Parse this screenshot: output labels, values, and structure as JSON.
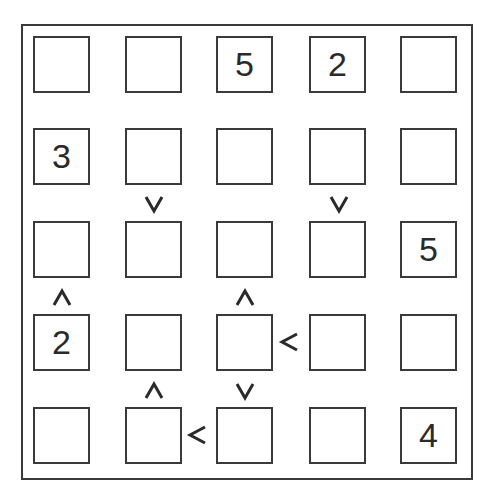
{
  "puzzle": {
    "type": "futoshiki",
    "size": 5,
    "grid": [
      [
        "",
        "",
        "5",
        "2",
        ""
      ],
      [
        "3",
        "",
        "",
        "",
        ""
      ],
      [
        "",
        "",
        "",
        "",
        "5"
      ],
      [
        "2",
        "",
        "",
        "",
        ""
      ],
      [
        "",
        "",
        "",
        "",
        "4"
      ]
    ],
    "constraints": [
      {
        "between": [
          [
            1,
            1
          ],
          [
            2,
            1
          ]
        ],
        "direction": "down",
        "glyph": "v",
        "meaning": "r1c1 > r2c1"
      },
      {
        "between": [
          [
            1,
            3
          ],
          [
            2,
            3
          ]
        ],
        "direction": "down",
        "glyph": "v",
        "meaning": "r1c3 > r2c3"
      },
      {
        "between": [
          [
            2,
            0
          ],
          [
            3,
            0
          ]
        ],
        "direction": "up",
        "glyph": "^",
        "meaning": "r2c0 < r3c0"
      },
      {
        "between": [
          [
            2,
            2
          ],
          [
            3,
            2
          ]
        ],
        "direction": "up",
        "glyph": "^",
        "meaning": "r2c2 < r3c2"
      },
      {
        "between": [
          [
            3,
            2
          ],
          [
            3,
            3
          ]
        ],
        "direction": "left",
        "glyph": "<",
        "meaning": "r3c2 < r3c3"
      },
      {
        "between": [
          [
            3,
            1
          ],
          [
            4,
            1
          ]
        ],
        "direction": "up",
        "glyph": "^",
        "meaning": "r3c1 < r4c1"
      },
      {
        "between": [
          [
            3,
            2
          ],
          [
            4,
            2
          ]
        ],
        "direction": "down",
        "glyph": "v",
        "meaning": "r3c2 > r4c2"
      },
      {
        "between": [
          [
            4,
            1
          ],
          [
            4,
            2
          ]
        ],
        "direction": "left",
        "glyph": "<",
        "meaning": "r4c1 < r4c2"
      }
    ]
  },
  "colors": {
    "line": "#3a3a3a",
    "text": "#2a2a2a",
    "background": "#ffffff"
  }
}
